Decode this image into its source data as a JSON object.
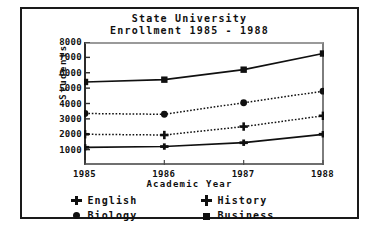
{
  "chart_data": {
    "type": "line",
    "title": "State University",
    "subtitle": "Enrollment 1985 - 1988",
    "xlabel": "Academic Year",
    "ylabel": "Students",
    "categories": [
      "1985",
      "1986",
      "1987",
      "1988"
    ],
    "x": [
      1985,
      1986,
      1987,
      1988
    ],
    "ylim": [
      0,
      8000
    ],
    "yticks": [
      8000,
      7000,
      6000,
      5000,
      4000,
      3000,
      2000,
      1000
    ],
    "ytick_labels": [
      "8000",
      "7000",
      "6000",
      "5000",
      "4000",
      "3000",
      "2000",
      "1000"
    ],
    "grid": false,
    "legend_position": "bottom",
    "series": [
      {
        "name": "English",
        "marker": "plus",
        "line_style": "solid",
        "color": "#101010",
        "values": [
          1150,
          1200,
          1450,
          2000
        ]
      },
      {
        "name": "History",
        "marker": "crosshair",
        "line_style": "dotted",
        "color": "#101010",
        "values": [
          2000,
          1950,
          2500,
          3200
        ]
      },
      {
        "name": "Biology",
        "marker": "dot",
        "line_style": "dotted",
        "color": "#101010",
        "values": [
          3350,
          3300,
          4050,
          4800
        ]
      },
      {
        "name": "Business",
        "marker": "square",
        "line_style": "solid",
        "color": "#101010",
        "values": [
          5400,
          5550,
          6200,
          7250
        ]
      }
    ]
  },
  "legend": {
    "items": [
      {
        "label": "English",
        "marker": "plus-marker-icon"
      },
      {
        "label": "History",
        "marker": "crosshair-marker-icon"
      },
      {
        "label": "Biology",
        "marker": "dot-marker-icon"
      },
      {
        "label": "Business",
        "marker": "square-marker-icon"
      }
    ]
  },
  "colors": {
    "ink": "#101010",
    "frame": "#1a1a1a",
    "axis": "#2b2b2b",
    "background": "#ffffff"
  }
}
